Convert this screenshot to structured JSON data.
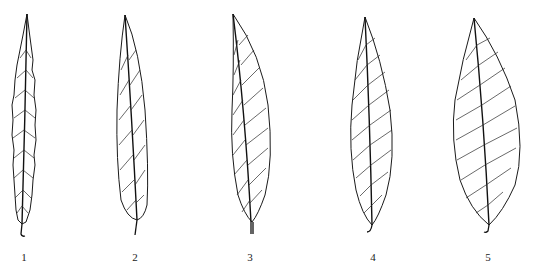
{
  "figure": {
    "leaves": [
      {
        "id": 1,
        "label": "1",
        "shape": "linear-lanceolate, serrate margin"
      },
      {
        "id": 2,
        "label": "2",
        "shape": "linear-lanceolate, entire margin"
      },
      {
        "id": 3,
        "label": "3",
        "shape": "lanceolate"
      },
      {
        "id": 4,
        "label": "4",
        "shape": "lanceolate"
      },
      {
        "id": 5,
        "label": "5",
        "shape": "elliptic-lanceolate"
      }
    ],
    "line_color": "#1a1a1a",
    "background_color": "#ffffff"
  }
}
